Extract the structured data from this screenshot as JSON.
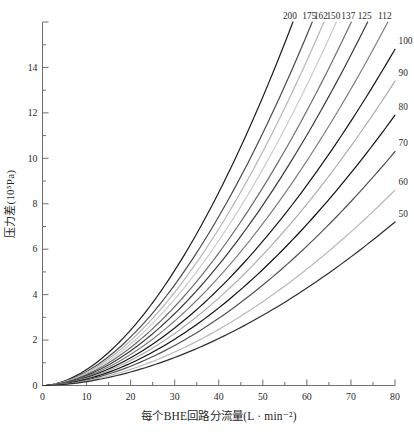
{
  "chart_data": {
    "type": "line",
    "title": "",
    "xlabel": "每个BHE回路分流量(L · min⁻²)",
    "ylabel": "压力差(10⁵Pa)",
    "xlim": [
      0,
      80
    ],
    "ylim": [
      0,
      16
    ],
    "x_major_ticks": [
      0,
      10,
      20,
      30,
      40,
      50,
      60,
      70,
      80
    ],
    "x_minor_ticks": [
      5,
      15,
      25,
      35,
      45,
      55,
      65,
      75
    ],
    "y_major_ticks": [
      0,
      2,
      4,
      6,
      8,
      10,
      12,
      14,
      16
    ],
    "y_tick_labels": [
      0,
      2,
      4,
      6,
      8,
      10,
      12,
      14
    ],
    "y_minor_ticks": [
      1,
      3,
      5,
      7,
      9,
      11,
      13,
      15
    ],
    "grid": false,
    "legend_position": "labels at line ends (top row and right edge)",
    "model": {
      "relation": "pressure_drop(Q) = dp_at_flow_80 * (Q/80)^exponent, curves clipped at top of axis (16)",
      "exponent": 1.8
    },
    "series": [
      {
        "label": "200",
        "color": "#1c1c1c",
        "dp_at_flow_80": 29.6
      },
      {
        "label": "175",
        "color": "#4a4a4a",
        "dp_at_flow_80": 25.9
      },
      {
        "label": "162",
        "color": "#b6b6b6",
        "dp_at_flow_80": 24.0
      },
      {
        "label": "150",
        "color": "#cbcbcb",
        "dp_at_flow_80": 22.2
      },
      {
        "label": "137",
        "color": "#6e6e6e",
        "dp_at_flow_80": 20.3
      },
      {
        "label": "125",
        "color": "#3a3a3a",
        "dp_at_flow_80": 18.5
      },
      {
        "label": "112",
        "color": "#7e7e7e",
        "dp_at_flow_80": 16.6
      },
      {
        "label": "100",
        "color": "#161616",
        "dp_at_flow_80": 14.8
      },
      {
        "label": "90",
        "color": "#aeaeae",
        "dp_at_flow_80": 13.4
      },
      {
        "label": "80",
        "color": "#0e0e0e",
        "dp_at_flow_80": 11.9
      },
      {
        "label": "70",
        "color": "#525252",
        "dp_at_flow_80": 10.3
      },
      {
        "label": "60",
        "color": "#b9b9b9",
        "dp_at_flow_80": 8.6
      },
      {
        "label": "50",
        "color": "#2d2d2d",
        "dp_at_flow_80": 7.2
      }
    ],
    "axis_color": "#6e6e6e",
    "text_color": "#1f1f1f"
  }
}
